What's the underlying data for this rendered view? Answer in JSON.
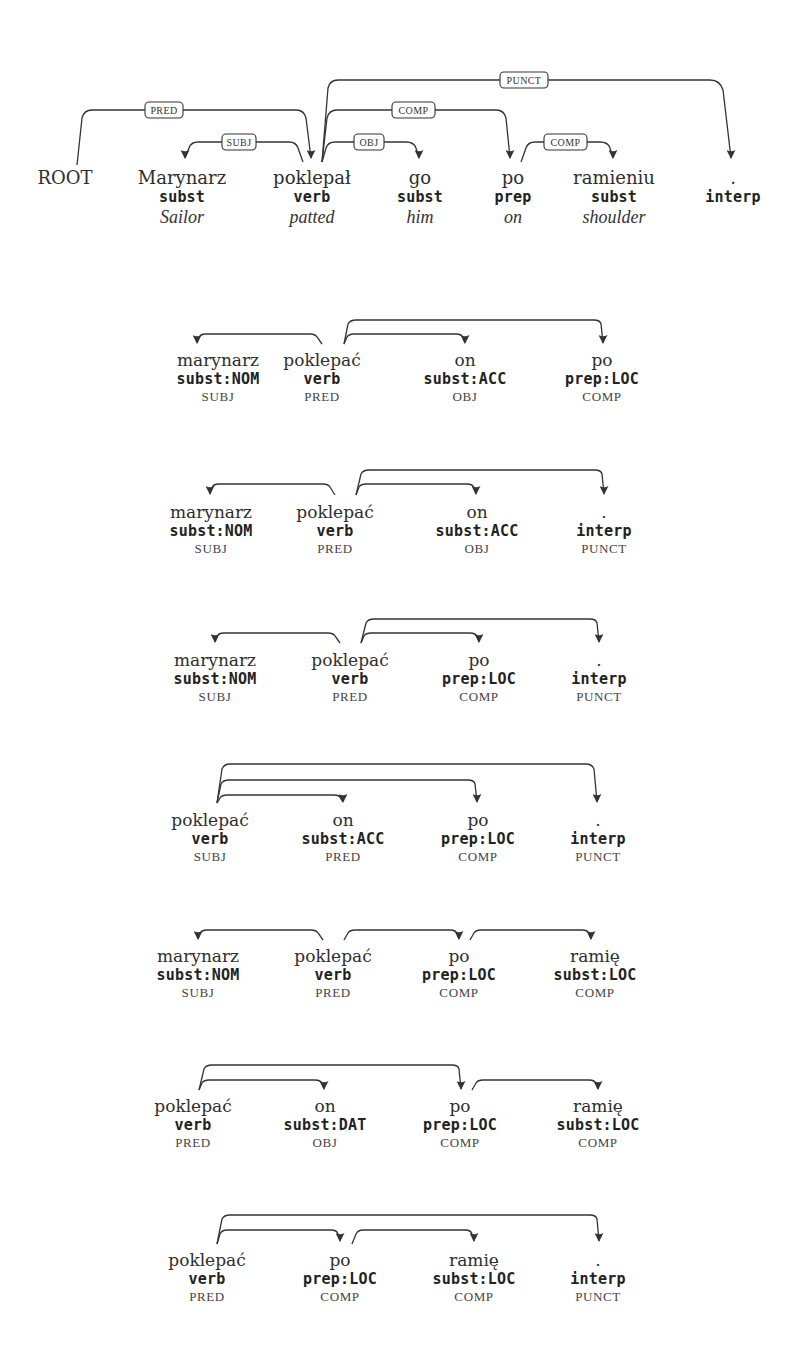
{
  "colors": {
    "ink": "#333333",
    "background": "#ffffff"
  },
  "main_tree": {
    "root_label": "ROOT",
    "tokens": [
      {
        "word": "Marynarz",
        "tag": "subst",
        "gloss": "Sailor"
      },
      {
        "word": "poklepał",
        "tag": "verb",
        "gloss": "patted"
      },
      {
        "word": "go",
        "tag": "subst",
        "gloss": "him"
      },
      {
        "word": "po",
        "tag": "prep",
        "gloss": "on"
      },
      {
        "word": "ramieniu",
        "tag": "subst",
        "gloss": "shoulder"
      },
      {
        "word": ".",
        "tag": "interp",
        "gloss": ""
      }
    ],
    "arcs": [
      {
        "label": "PRED",
        "from": "ROOT",
        "to": "poklepał"
      },
      {
        "label": "SUBJ",
        "from": "poklepał",
        "to": "Marynarz"
      },
      {
        "label": "OBJ",
        "from": "poklepał",
        "to": "go"
      },
      {
        "label": "COMP",
        "from": "poklepał",
        "to": "po"
      },
      {
        "label": "PUNCT",
        "from": "poklepał",
        "to": "."
      },
      {
        "label": "COMP",
        "from": "po",
        "to": "ramieniu"
      }
    ]
  },
  "subtrees": [
    {
      "tokens": [
        {
          "lemma": "marynarz",
          "tag": "subst:NOM",
          "role": "SUBJ"
        },
        {
          "lemma": "poklepać",
          "tag": "verb",
          "role": "PRED"
        },
        {
          "lemma": "on",
          "tag": "subst:ACC",
          "role": "OBJ"
        },
        {
          "lemma": "po",
          "tag": "prep:LOC",
          "role": "COMP"
        }
      ]
    },
    {
      "tokens": [
        {
          "lemma": "marynarz",
          "tag": "subst:NOM",
          "role": "SUBJ"
        },
        {
          "lemma": "poklepać",
          "tag": "verb",
          "role": "PRED"
        },
        {
          "lemma": "on",
          "tag": "subst:ACC",
          "role": "OBJ"
        },
        {
          "lemma": ".",
          "tag": "interp",
          "role": "PUNCT"
        }
      ]
    },
    {
      "tokens": [
        {
          "lemma": "marynarz",
          "tag": "subst:NOM",
          "role": "SUBJ"
        },
        {
          "lemma": "poklepać",
          "tag": "verb",
          "role": "PRED"
        },
        {
          "lemma": "po",
          "tag": "prep:LOC",
          "role": "COMP"
        },
        {
          "lemma": ".",
          "tag": "interp",
          "role": "PUNCT"
        }
      ]
    },
    {
      "tokens": [
        {
          "lemma": "poklepać",
          "tag": "verb",
          "role": "SUBJ"
        },
        {
          "lemma": "on",
          "tag": "subst:ACC",
          "role": "PRED"
        },
        {
          "lemma": "po",
          "tag": "prep:LOC",
          "role": "COMP"
        },
        {
          "lemma": ".",
          "tag": "interp",
          "role": "PUNCT"
        }
      ]
    },
    {
      "tokens": [
        {
          "lemma": "marynarz",
          "tag": "subst:NOM",
          "role": "SUBJ"
        },
        {
          "lemma": "poklepać",
          "tag": "verb",
          "role": "PRED"
        },
        {
          "lemma": "po",
          "tag": "prep:LOC",
          "role": "COMP"
        },
        {
          "lemma": "ramię",
          "tag": "subst:LOC",
          "role": "COMP"
        }
      ]
    },
    {
      "tokens": [
        {
          "lemma": "poklepać",
          "tag": "verb",
          "role": "PRED"
        },
        {
          "lemma": "on",
          "tag": "subst:DAT",
          "role": "OBJ"
        },
        {
          "lemma": "po",
          "tag": "prep:LOC",
          "role": "COMP"
        },
        {
          "lemma": "ramię",
          "tag": "subst:LOC",
          "role": "COMP"
        }
      ]
    },
    {
      "tokens": [
        {
          "lemma": "poklepać",
          "tag": "verb",
          "role": "PRED"
        },
        {
          "lemma": "po",
          "tag": "prep:LOC",
          "role": "COMP"
        },
        {
          "lemma": "ramię",
          "tag": "subst:LOC",
          "role": "COMP"
        },
        {
          "lemma": ".",
          "tag": "interp",
          "role": "PUNCT"
        }
      ]
    }
  ]
}
